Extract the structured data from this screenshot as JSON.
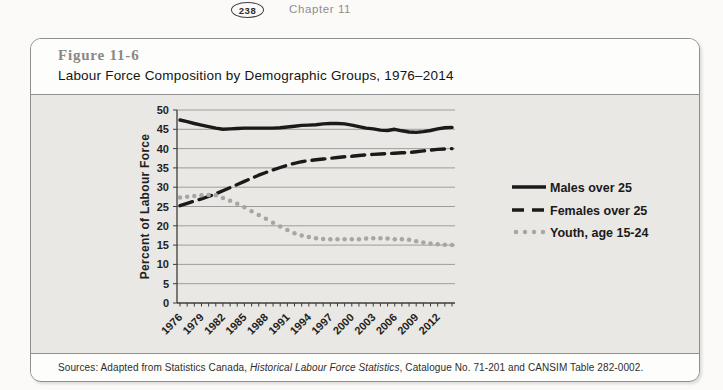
{
  "header": {
    "page_number": "238",
    "chapter": "Chapter 11"
  },
  "figure": {
    "number": "Figure 11-6",
    "title": "Labour Force Composition by Demographic Groups, 1976–2014"
  },
  "sources": {
    "prefix": "Sources: Adapted from Statistics Canada, ",
    "italic": "Historical Labour Force Statistics",
    "suffix": ", Catalogue No. 71-201 and CANSIM Table 282-0002."
  },
  "chart_data": {
    "type": "line",
    "title": "",
    "xlabel": "",
    "ylabel": "Percent of Labour Force",
    "ylim": [
      0,
      50
    ],
    "ytick_step": 5,
    "grid": true,
    "legend_position": "right",
    "x": [
      1976,
      1977,
      1978,
      1979,
      1980,
      1981,
      1982,
      1983,
      1984,
      1985,
      1986,
      1987,
      1988,
      1989,
      1990,
      1991,
      1992,
      1993,
      1994,
      1995,
      1996,
      1997,
      1998,
      1999,
      2000,
      2001,
      2002,
      2003,
      2004,
      2005,
      2006,
      2007,
      2008,
      2009,
      2010,
      2011,
      2012,
      2013,
      2014
    ],
    "xtick_labels": [
      "1976",
      "1979",
      "1982",
      "1985",
      "1988",
      "1991",
      "1994",
      "1997",
      "2000",
      "2003",
      "2006",
      "2009",
      "2012"
    ],
    "series": [
      {
        "name": "Males over 25",
        "style": "solid",
        "color": "#1a1a1a",
        "values": [
          47.4,
          47.0,
          46.5,
          46.1,
          45.7,
          45.3,
          45.0,
          45.1,
          45.2,
          45.3,
          45.3,
          45.3,
          45.3,
          45.3,
          45.4,
          45.6,
          45.8,
          46.0,
          46.1,
          46.2,
          46.4,
          46.5,
          46.5,
          46.4,
          46.1,
          45.7,
          45.3,
          45.1,
          44.8,
          44.7,
          45.0,
          44.6,
          44.3,
          44.2,
          44.4,
          44.7,
          45.1,
          45.4,
          45.5
        ]
      },
      {
        "name": "Females over 25",
        "style": "dashed",
        "color": "#1a1a1a",
        "values": [
          25.2,
          25.8,
          26.4,
          27.0,
          27.6,
          28.3,
          29.1,
          29.9,
          30.7,
          31.5,
          32.3,
          33.1,
          33.8,
          34.5,
          35.1,
          35.7,
          36.2,
          36.6,
          36.9,
          37.1,
          37.3,
          37.5,
          37.7,
          37.9,
          38.0,
          38.2,
          38.4,
          38.5,
          38.6,
          38.7,
          38.8,
          38.9,
          39.0,
          39.2,
          39.4,
          39.6,
          39.8,
          39.9,
          40.0
        ]
      },
      {
        "name": "Youth, age 15-24",
        "style": "dotted",
        "color": "#a6a6a6",
        "values": [
          27.3,
          27.5,
          27.7,
          27.9,
          28.0,
          27.9,
          27.2,
          26.5,
          25.7,
          24.8,
          23.8,
          22.8,
          21.8,
          20.8,
          19.8,
          18.9,
          18.1,
          17.5,
          17.1,
          16.8,
          16.6,
          16.5,
          16.5,
          16.5,
          16.5,
          16.5,
          16.7,
          16.8,
          16.8,
          16.7,
          16.5,
          16.5,
          16.4,
          16.0,
          15.7,
          15.4,
          15.2,
          15.1,
          15.0
        ]
      }
    ]
  }
}
